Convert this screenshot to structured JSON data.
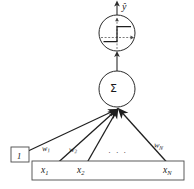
{
  "diagram": {
    "type": "neural-network-node",
    "stroke_color": "#2b2b2b",
    "fill_color": "#ffffff",
    "background": "#ffffff",
    "output": {
      "label": "ŷ",
      "arrow": "up-arrow"
    },
    "activation": {
      "node_label": "",
      "icon": "step-function-icon",
      "shape": "circle",
      "center_x": 117,
      "center_y": 33,
      "radius": 18
    },
    "summation": {
      "label": "Σ",
      "shape": "circle",
      "center_x": 117,
      "center_y": 89,
      "radius": 18
    },
    "bias": {
      "value": "1",
      "shape": "box"
    },
    "weights": [
      {
        "base": "w",
        "sub": "1"
      },
      {
        "base": "w",
        "sub": "2"
      },
      {
        "base": "w",
        "sub": "N"
      }
    ],
    "weights_ellipsis": "· · ·",
    "inputs": {
      "container": "input-vector-bar",
      "items": [
        {
          "base": "x",
          "sub": "1"
        },
        {
          "base": "x",
          "sub": "2"
        },
        {
          "base": "x",
          "sub": "N"
        }
      ]
    }
  }
}
